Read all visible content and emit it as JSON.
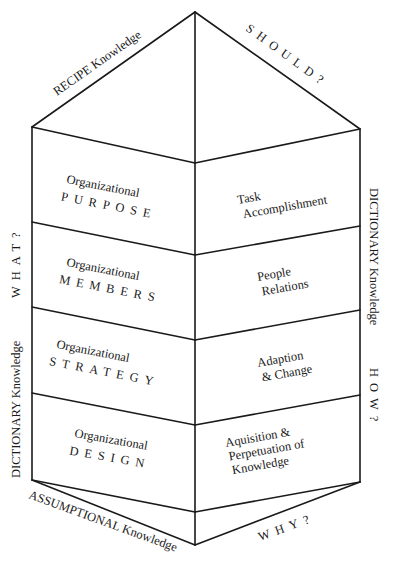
{
  "diagram": {
    "type": "hexagonal-prism-knowledge-model",
    "top_labels": {
      "left": "RECIPE Knowledge",
      "right": "SHOULD?"
    },
    "side_labels": {
      "left_prefix": "DICTIONARY Knowledge",
      "left_question": "WHAT?",
      "right_prefix": "DICTIONARY Knowledge",
      "right_question": "HOW?"
    },
    "bottom_labels": {
      "left": "ASSUMPTIONAL Knowledge",
      "right": "WHY?"
    },
    "left_panels": [
      {
        "line1": "Organizational",
        "line2": "PURPOSE"
      },
      {
        "line1": "Organizational",
        "line2": "MEMBERS"
      },
      {
        "line1": "Organizational",
        "line2": "STRATEGY"
      },
      {
        "line1": "Organizational",
        "line2": "DESIGN"
      }
    ],
    "right_panels": [
      {
        "lines": [
          "Task",
          "Accomplishment"
        ]
      },
      {
        "lines": [
          "People",
          "Relations"
        ]
      },
      {
        "lines": [
          "Adaption",
          "& Change"
        ]
      },
      {
        "lines": [
          "Aquisition &",
          "Perpetuation of",
          "Knowledge"
        ]
      }
    ],
    "colors": {
      "line": "#1a1a1a",
      "background": "#ffffff"
    }
  }
}
